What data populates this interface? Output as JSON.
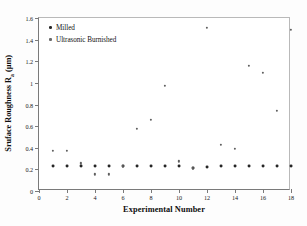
{
  "chart_data": {
    "type": "scatter",
    "title": "",
    "xlabel": "Experimental Number",
    "ylabel_prefix": "Sruface Roughness R",
    "ylabel_sub": "a",
    "ylabel_suffix": " (µm)",
    "ylabel_full": "Sruface Roughness Ra (µm)",
    "xlim": [
      0,
      18
    ],
    "ylim": [
      0,
      1.6
    ],
    "xticks": [
      0,
      2,
      4,
      6,
      8,
      10,
      12,
      14,
      16,
      18
    ],
    "xtick_labels": [
      "0",
      "2",
      "4",
      "6",
      "8",
      "10",
      "12",
      "14",
      "16",
      "18"
    ],
    "yticks": [
      0,
      0.2,
      0.4,
      0.6,
      0.8,
      1.0,
      1.2,
      1.4,
      1.6
    ],
    "ytick_labels": [
      "0",
      "0.2",
      "0.4",
      "0.6",
      "0.8",
      "1",
      "1.2",
      "1.4",
      "1.6"
    ],
    "grid": false,
    "legend_position": "top-left",
    "x": [
      1,
      2,
      3,
      4,
      5,
      6,
      7,
      8,
      9,
      10,
      11,
      12,
      13,
      14,
      15,
      16,
      17,
      18
    ],
    "series": [
      {
        "name": "Milled",
        "marker": "filled-circle",
        "color": "#262626",
        "values": [
          0.228,
          0.228,
          0.228,
          0.228,
          0.228,
          0.228,
          0.228,
          0.228,
          0.228,
          0.228,
          0.215,
          0.218,
          0.228,
          0.228,
          0.228,
          0.228,
          0.228,
          0.228
        ]
      },
      {
        "name": "Ultrasonic Burnished",
        "marker": "filled-circle",
        "color": "#5d5d5d",
        "values": [
          0.37,
          0.37,
          0.255,
          0.155,
          0.155,
          0.228,
          0.575,
          0.655,
          0.97,
          0.275,
          0.21,
          1.51,
          0.425,
          0.39,
          1.155,
          1.09,
          0.74,
          1.49
        ]
      }
    ]
  },
  "legend": {
    "items": [
      {
        "label": "Milled",
        "marker_class": "milled"
      },
      {
        "label": "Ultrasonic Burnished",
        "marker_class": "burnished"
      }
    ]
  }
}
